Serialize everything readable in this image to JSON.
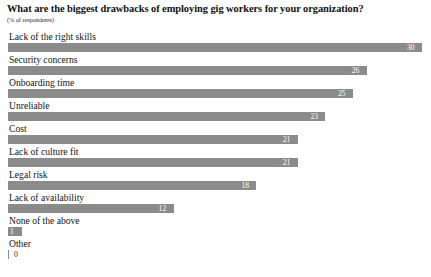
{
  "chart_data": {
    "type": "bar",
    "orientation": "horizontal",
    "title": "What are the biggest drawbacks of employing gig workers for your organization?",
    "subtitle": "(% of respondents)",
    "xlabel": "",
    "ylabel": "",
    "xlim": [
      0,
      30
    ],
    "grid": false,
    "legend": false,
    "bar_color": "#8b8b8b",
    "value_label_color": "#ffffff",
    "categories": [
      "Lack of the right skills",
      "Security concerns",
      "Onboarding time",
      "Unreliable",
      "Cost",
      "Lack of culture fit",
      "Legal risk",
      "Lack of availability",
      "None of the above",
      "Other"
    ],
    "values": [
      30,
      26,
      25,
      23,
      21,
      21,
      18,
      12,
      1,
      0
    ],
    "value_labels": [
      "30",
      "26",
      "25",
      "23",
      "21",
      "21",
      "18",
      "12",
      "1",
      "0"
    ]
  }
}
